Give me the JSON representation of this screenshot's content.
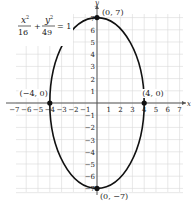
{
  "chart_data": {
    "type": "line",
    "title": "",
    "equation": {
      "x_num": "x",
      "x_den": "16",
      "y_num": "y",
      "y_den": "49",
      "plus": "+",
      "equals": "= 1",
      "sup": "2"
    },
    "xlabel": "x",
    "ylabel": "y",
    "xlim": [
      -7,
      7
    ],
    "ylim": [
      -7,
      7
    ],
    "grid": true,
    "x_ticks": [
      -7,
      -6,
      -5,
      -4,
      -3,
      -2,
      -1,
      1,
      2,
      3,
      4,
      5,
      6,
      7
    ],
    "y_ticks": [
      -7,
      -6,
      -5,
      -4,
      -3,
      -2,
      -1,
      1,
      2,
      3,
      4,
      5,
      6,
      7
    ],
    "x_tick_labels": [
      "−7",
      "−6",
      "−5",
      "−4",
      "−3",
      "−2",
      "−1",
      "1",
      "2",
      "3",
      "4",
      "5",
      "6",
      "7"
    ],
    "y_tick_labels": [
      "−7",
      "−6",
      "−5",
      "−4",
      "−3",
      "−2",
      "−1",
      "1",
      "2",
      "3",
      "4",
      "5",
      "6",
      "7"
    ],
    "series": [
      {
        "name": "ellipse x^2/16 + y^2/49 = 1",
        "a": 4,
        "b": 7,
        "center": [
          0,
          0
        ]
      }
    ],
    "points": [
      {
        "x": 0,
        "y": 7,
        "label": "(0, 7)"
      },
      {
        "x": 4,
        "y": 0,
        "label": "(4, 0)"
      },
      {
        "x": -4,
        "y": 0,
        "label": "(−4, 0)"
      },
      {
        "x": 0,
        "y": -7,
        "label": "(0, −7)"
      }
    ],
    "colors": {
      "curve": "#111111",
      "grid": "#d8d8d8",
      "axis": "#555555"
    }
  }
}
